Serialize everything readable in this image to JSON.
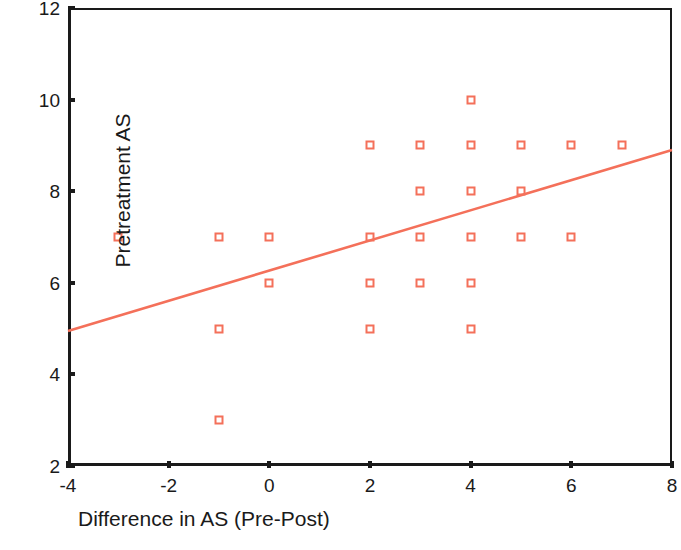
{
  "chart_data": {
    "type": "scatter",
    "title": "",
    "xlabel": "Difference in AS (Pre-Post)",
    "ylabel": "Pretreatment AS",
    "xlim": [
      -4,
      8
    ],
    "ylim": [
      2,
      12
    ],
    "xticks": [
      "-4",
      "-2",
      "0",
      "2",
      "4",
      "6",
      "8"
    ],
    "xtick_values": [
      -4,
      -2,
      0,
      2,
      4,
      6,
      8
    ],
    "yticks": [
      "2",
      "4",
      "6",
      "8",
      "10",
      "12"
    ],
    "ytick_values": [
      2,
      4,
      6,
      8,
      10,
      12
    ],
    "grid": false,
    "legend": null,
    "marker_style": "open-square",
    "marker_color": "#f4705a",
    "axis_color": "#1a1a1a",
    "background": "#ffffff",
    "points": [
      {
        "x": -3,
        "y": 7
      },
      {
        "x": -1,
        "y": 7
      },
      {
        "x": -1,
        "y": 5
      },
      {
        "x": -1,
        "y": 3
      },
      {
        "x": 0,
        "y": 7
      },
      {
        "x": 0,
        "y": 6
      },
      {
        "x": 2,
        "y": 9
      },
      {
        "x": 2,
        "y": 7
      },
      {
        "x": 2,
        "y": 6
      },
      {
        "x": 2,
        "y": 5
      },
      {
        "x": 3,
        "y": 9
      },
      {
        "x": 3,
        "y": 8
      },
      {
        "x": 3,
        "y": 7
      },
      {
        "x": 3,
        "y": 6
      },
      {
        "x": 4,
        "y": 10
      },
      {
        "x": 4,
        "y": 9
      },
      {
        "x": 4,
        "y": 8
      },
      {
        "x": 4,
        "y": 7
      },
      {
        "x": 4,
        "y": 6
      },
      {
        "x": 4,
        "y": 5
      },
      {
        "x": 5,
        "y": 9
      },
      {
        "x": 5,
        "y": 8
      },
      {
        "x": 5,
        "y": 7
      },
      {
        "x": 6,
        "y": 9
      },
      {
        "x": 6,
        "y": 7
      },
      {
        "x": 7,
        "y": 9
      }
    ],
    "fit_line": {
      "type": "linear-regression",
      "color": "#f4705a",
      "x_start": -4,
      "y_start": 4.95,
      "x_end": 8,
      "y_end": 8.9
    }
  }
}
